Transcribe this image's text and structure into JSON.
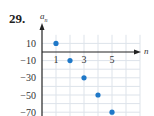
{
  "problem_number": "29.",
  "chart_data": {
    "type": "scatter",
    "title": "",
    "xlabel": "n",
    "ylabel": "a_n",
    "x": [
      1,
      2,
      3,
      4,
      5
    ],
    "y": [
      10,
      -10,
      -30,
      -50,
      -70
    ],
    "x_ticks": [
      "1",
      "3",
      "5"
    ],
    "y_ticks": [
      "10",
      "-10",
      "-30",
      "-50",
      "-70"
    ],
    "xlim": [
      0,
      6
    ],
    "ylim": [
      -72,
      20
    ],
    "grid": true,
    "marker_color": "#1f78c8"
  },
  "labels": {
    "ylabel_base": "a",
    "ylabel_sub": "n",
    "xlabel": "n"
  }
}
